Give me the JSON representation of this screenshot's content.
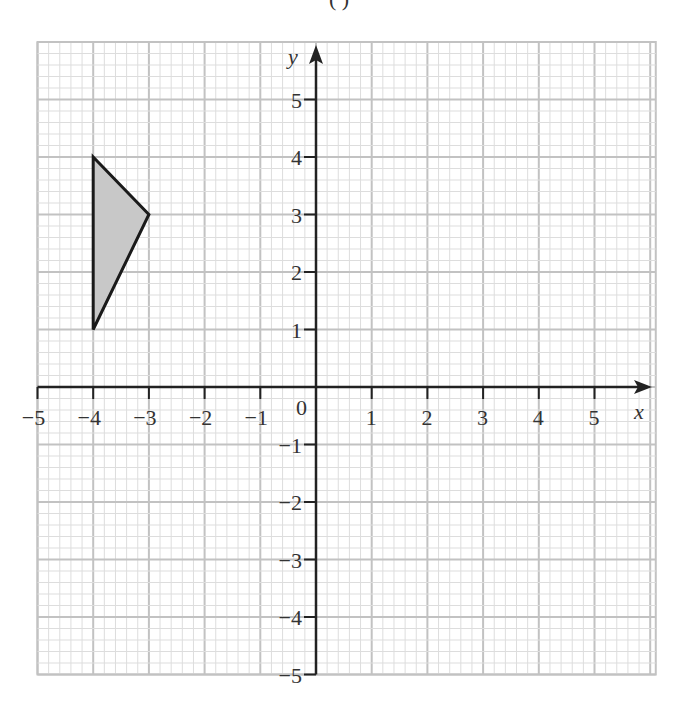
{
  "header": {
    "partial_label": "( )"
  },
  "grid": {
    "x_min": -5,
    "x_max": 6.1,
    "y_min": -5,
    "y_max": 6,
    "minor_per_unit": 5,
    "major_color": "#c2c2c2",
    "minor_color": "#dddddd",
    "axis_color": "#222222"
  },
  "axes": {
    "x_label": "x",
    "y_label": "y",
    "origin_label": "0",
    "x_ticks": [
      {
        "value": -5,
        "label": "−5"
      },
      {
        "value": -4,
        "label": "−4"
      },
      {
        "value": -3,
        "label": "−3"
      },
      {
        "value": -2,
        "label": "−2"
      },
      {
        "value": -1,
        "label": "−1"
      },
      {
        "value": 1,
        "label": "1"
      },
      {
        "value": 2,
        "label": "2"
      },
      {
        "value": 3,
        "label": "3"
      },
      {
        "value": 4,
        "label": "4"
      },
      {
        "value": 5,
        "label": "5"
      }
    ],
    "y_ticks": [
      {
        "value": 5,
        "label": "5"
      },
      {
        "value": 4,
        "label": "4"
      },
      {
        "value": 3,
        "label": "3"
      },
      {
        "value": 2,
        "label": "2"
      },
      {
        "value": 1,
        "label": "1"
      },
      {
        "value": -1,
        "label": "−1"
      },
      {
        "value": -2,
        "label": "−2"
      },
      {
        "value": -3,
        "label": "−3"
      },
      {
        "value": -4,
        "label": "−4"
      },
      {
        "value": -5,
        "label": "−5"
      }
    ]
  },
  "shapes": [
    {
      "name": "triangle",
      "vertices": [
        [
          -4,
          4
        ],
        [
          -3,
          3
        ],
        [
          -4,
          1
        ]
      ],
      "fill": "#c8c8c8",
      "stroke": "#1a1a1a"
    }
  ]
}
